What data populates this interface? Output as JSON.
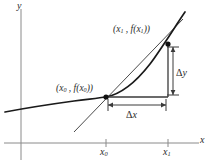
{
  "figure": {
    "type": "secant-line-difference-quotient-diagram",
    "background_color": "#ffffff",
    "ink_color": "#2b2b2b",
    "curve_color": "#1a1a1a",
    "axis_color": "#7a7a7a",
    "axes": {
      "x_label": "x",
      "y_label": "y",
      "x_axis_y_px": 143,
      "y_axis_x_px": 21,
      "ticks": [
        {
          "name": "x0",
          "label_base": "x",
          "label_sub": "0",
          "x_px": 106
        },
        {
          "name": "x1",
          "label_base": "x",
          "label_sub": "1",
          "x_px": 168
        }
      ]
    },
    "points": [
      {
        "name": "point-x0",
        "label_parts": {
          "open": "(",
          "base1": "x",
          "sub1": "0",
          "sep": " , ",
          "fn": "f(",
          "base2": "x",
          "sub2": "0",
          "close": "))"
        },
        "label_text": "(x0 , f(x0))",
        "x_px": 106,
        "y_px": 97
      },
      {
        "name": "point-x1",
        "label_parts": {
          "open": "(",
          "base1": "x",
          "sub1": "1",
          "sep": " , ",
          "fn": "f(",
          "base2": "x",
          "sub2": "1",
          "close": "))"
        },
        "label_text": "(x1 , f(x1))",
        "x_px": 168,
        "y_px": 44
      }
    ],
    "annotations": [
      {
        "name": "delta-y",
        "symbol": "Δ",
        "variable": "y",
        "text": "Δy"
      },
      {
        "name": "delta-x",
        "symbol": "Δ",
        "variable": "x",
        "text": "Δx"
      }
    ],
    "curve": {
      "description": "increasing function, flat on the left, concave up on the right",
      "path": "M 5,112 C 26,108 52,104 74,101 C 90,99 99,98 106,97 C 122,94 136,82 150,64 C 162,48 176,25 185,12"
    },
    "secant_line": {
      "from_px": [
        74,
        132
      ],
      "to_px": [
        183,
        19
      ]
    },
    "triangle": {
      "corner_px": [
        106,
        97
      ],
      "right_angle_px": [
        168,
        97
      ],
      "top_px": [
        168,
        44
      ]
    }
  }
}
